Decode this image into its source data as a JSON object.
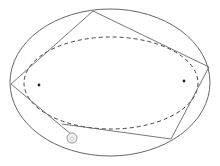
{
  "diagram": {
    "type": "elliptical-billiard",
    "width": 220,
    "height": 166,
    "colors": {
      "background": "#ffffff",
      "stroke": "#666666",
      "dashed": "#444444",
      "focus": "#222222",
      "ball_fill": "#f2f2f2",
      "ball_stroke": "#9a9a9a"
    },
    "outer_ellipse": {
      "cx": 110,
      "cy": 82.5,
      "rx": 100,
      "ry": 73.5
    },
    "caustic_ellipse": {
      "cx": 111,
      "cy": 83,
      "rx": 87,
      "ry": 46,
      "dash": "4 3"
    },
    "foci": [
      {
        "x": 39,
        "y": 85
      },
      {
        "x": 184,
        "y": 81
      }
    ],
    "trajectory": {
      "points": "72,135 11,84 93,11 209,67 171,139 62,124"
    },
    "ball": {
      "cx": 72,
      "cy": 138,
      "r": 5
    }
  }
}
